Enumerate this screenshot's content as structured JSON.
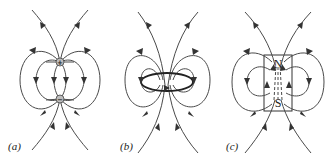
{
  "figure": {
    "panels": [
      {
        "id": "a",
        "label": "(a)",
        "description": "Electric dipole field lines",
        "top_charge_symbol": "+",
        "bottom_charge_symbol": "−"
      },
      {
        "id": "b",
        "label": "(b)",
        "description": "Magnetic field of a current loop"
      },
      {
        "id": "c",
        "label": "(c)",
        "description": "Magnetic field of a bar magnet",
        "north_label": "N",
        "south_label": "S"
      }
    ],
    "colors": {
      "line": "#4a4a4a",
      "arrow": "#333333",
      "charge_fill": "#bdbdbd"
    }
  }
}
